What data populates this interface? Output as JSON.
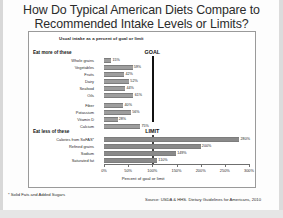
{
  "title": {
    "line1": "How Do Typical American Diets Compare to",
    "line2": "Recommended Intake Levels or Limits?"
  },
  "chart_header": "Usual intake as a percent of goal or limit",
  "groups": {
    "more_label": "Eat more of these",
    "less_label": "Eat less of these"
  },
  "reference": {
    "goal_label": "GOAL",
    "limit_label": "LIMIT",
    "goal_value": 100,
    "limit_value": 100
  },
  "footnote": "* Solid Fats and Added Sugars",
  "source": "Source: USDA & HHS. Dietary Guidelines for Americans, 2010",
  "chart_data": {
    "type": "bar",
    "orientation": "horizontal",
    "title": "Usual intake as a percent of goal or limit",
    "xlabel": "Percent of goal or limit",
    "ylabel": "",
    "xlim": [
      0,
      300
    ],
    "xticks": [
      0,
      50,
      100,
      150,
      200,
      250,
      300
    ],
    "xticklabels": [
      "0%",
      "50%",
      "100%",
      "150%",
      "200%",
      "250%",
      "300%"
    ],
    "grid": false,
    "legend": false,
    "reference_lines": [
      {
        "label": "GOAL",
        "value": 100,
        "group": "Eat more of these"
      },
      {
        "label": "LIMIT",
        "value": 100,
        "group": "Eat less of these"
      }
    ],
    "groups": [
      {
        "name": "Eat more of these",
        "categories": [
          "Whole grains",
          "Vegetables",
          "Fruits",
          "Dairy",
          "Seafood",
          "Oils",
          "Fiber",
          "Potassium",
          "Vitamin D",
          "Calcium"
        ],
        "values": [
          15,
          59,
          42,
          52,
          44,
          61,
          40,
          56,
          28,
          75
        ],
        "labels": [
          "15%",
          "59%",
          "42%",
          "52%",
          "44%",
          "61%",
          "40%",
          "56%",
          "28%",
          "75%"
        ]
      },
      {
        "name": "Eat less of these",
        "categories": [
          "Calories from SoFAS*",
          "Refined grains",
          "Sodium",
          "Saturated fat"
        ],
        "values": [
          280,
          200,
          149,
          110
        ],
        "labels": [
          "280%",
          "200%",
          "149%",
          "110%"
        ]
      }
    ]
  }
}
